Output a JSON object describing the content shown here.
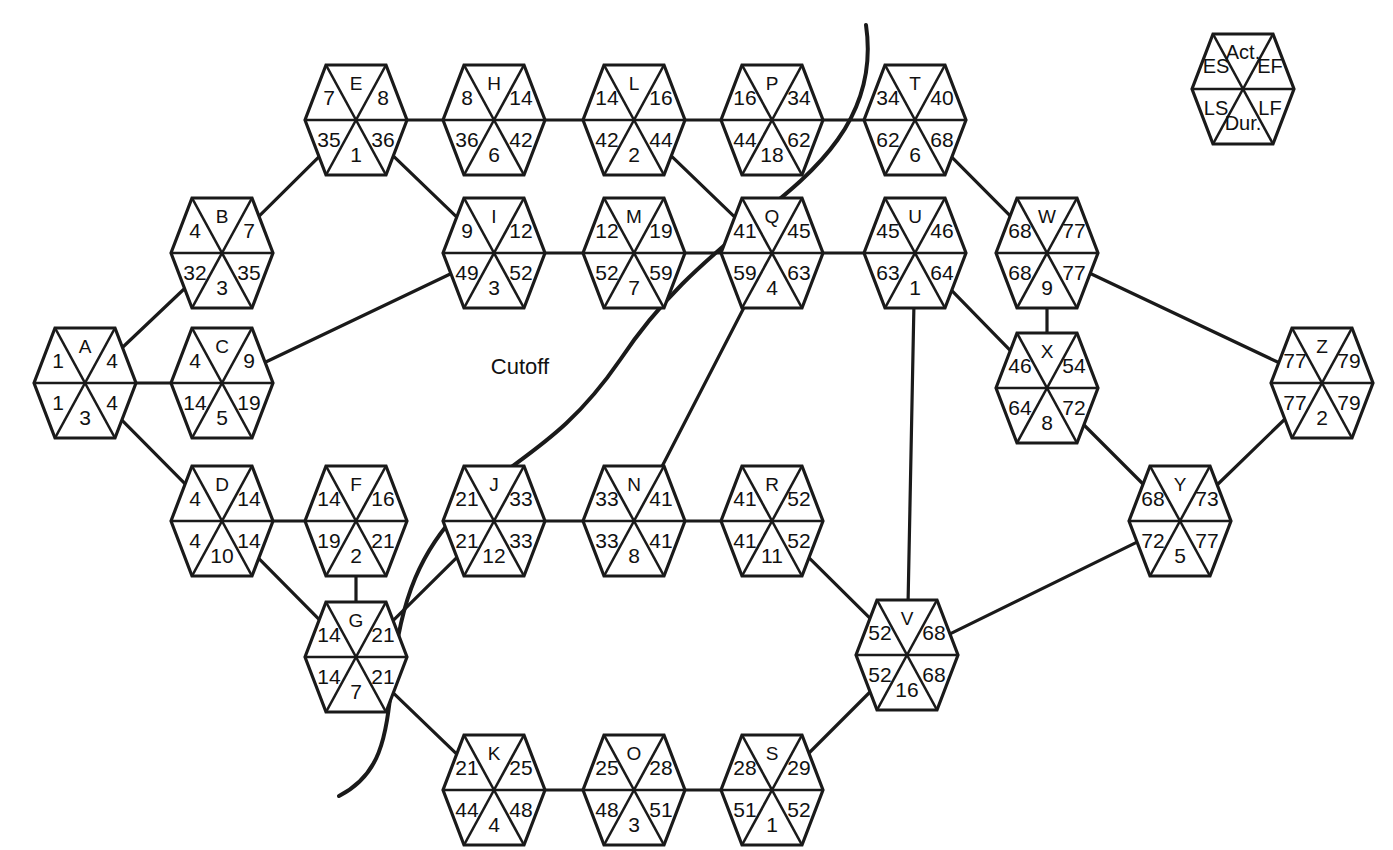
{
  "diagram": {
    "cutoff_label": "Cutoff",
    "node_shape": "hexagon",
    "line_color": "#1a1a1a",
    "background_color": "#ffffff",
    "legend": {
      "name": "legend-hexagon",
      "act": "Act.",
      "es": "ES",
      "ef": "EF",
      "ls": "LS",
      "lf": "LF",
      "dur": "Dur.",
      "cx": 1243,
      "cy": 89
    },
    "nodes": [
      {
        "id": "A",
        "act": "A",
        "es": "1",
        "ef": "4",
        "ls": "1",
        "lf": "4",
        "dur": "3",
        "cx": 85,
        "cy": 383
      },
      {
        "id": "B",
        "act": "B",
        "es": "4",
        "ef": "7",
        "ls": "32",
        "lf": "35",
        "dur": "3",
        "cx": 222,
        "cy": 253
      },
      {
        "id": "C",
        "act": "C",
        "es": "4",
        "ef": "9",
        "ls": "14",
        "lf": "19",
        "dur": "5",
        "cx": 222,
        "cy": 383
      },
      {
        "id": "D",
        "act": "D",
        "es": "4",
        "ef": "14",
        "ls": "4",
        "lf": "14",
        "dur": "10",
        "cx": 222,
        "cy": 521
      },
      {
        "id": "E",
        "act": "E",
        "es": "7",
        "ef": "8",
        "ls": "35",
        "lf": "36",
        "dur": "1",
        "cx": 356,
        "cy": 120
      },
      {
        "id": "F",
        "act": "F",
        "es": "14",
        "ef": "16",
        "ls": "19",
        "lf": "21",
        "dur": "2",
        "cx": 356,
        "cy": 521
      },
      {
        "id": "G",
        "act": "G",
        "es": "14",
        "ef": "21",
        "ls": "14",
        "lf": "21",
        "dur": "7",
        "cx": 356,
        "cy": 657
      },
      {
        "id": "H",
        "act": "H",
        "es": "8",
        "ef": "14",
        "ls": "36",
        "lf": "42",
        "dur": "6",
        "cx": 494,
        "cy": 120
      },
      {
        "id": "I",
        "act": "I",
        "es": "9",
        "ef": "12",
        "ls": "49",
        "lf": "52",
        "dur": "3",
        "cx": 494,
        "cy": 253
      },
      {
        "id": "J",
        "act": "J",
        "es": "21",
        "ef": "33",
        "ls": "21",
        "lf": "33",
        "dur": "12",
        "cx": 494,
        "cy": 521
      },
      {
        "id": "K",
        "act": "K",
        "es": "21",
        "ef": "25",
        "ls": "44",
        "lf": "48",
        "dur": "4",
        "cx": 494,
        "cy": 790
      },
      {
        "id": "L",
        "act": "L",
        "es": "14",
        "ef": "16",
        "ls": "42",
        "lf": "44",
        "dur": "2",
        "cx": 634,
        "cy": 120
      },
      {
        "id": "M",
        "act": "M",
        "es": "12",
        "ef": "19",
        "ls": "52",
        "lf": "59",
        "dur": "7",
        "cx": 634,
        "cy": 253
      },
      {
        "id": "N",
        "act": "N",
        "es": "33",
        "ef": "41",
        "ls": "33",
        "lf": "41",
        "dur": "8",
        "cx": 634,
        "cy": 521
      },
      {
        "id": "O",
        "act": "O",
        "es": "25",
        "ef": "28",
        "ls": "48",
        "lf": "51",
        "dur": "3",
        "cx": 634,
        "cy": 790
      },
      {
        "id": "P",
        "act": "P",
        "es": "16",
        "ef": "34",
        "ls": "44",
        "lf": "62",
        "dur": "18",
        "cx": 772,
        "cy": 120
      },
      {
        "id": "Q",
        "act": "Q",
        "es": "41",
        "ef": "45",
        "ls": "59",
        "lf": "63",
        "dur": "4",
        "cx": 772,
        "cy": 253
      },
      {
        "id": "R",
        "act": "R",
        "es": "41",
        "ef": "52",
        "ls": "41",
        "lf": "52",
        "dur": "11",
        "cx": 772,
        "cy": 521
      },
      {
        "id": "S",
        "act": "S",
        "es": "28",
        "ef": "29",
        "ls": "51",
        "lf": "52",
        "dur": "1",
        "cx": 772,
        "cy": 790
      },
      {
        "id": "T",
        "act": "T",
        "es": "34",
        "ef": "40",
        "ls": "62",
        "lf": "68",
        "dur": "6",
        "cx": 915,
        "cy": 120
      },
      {
        "id": "U",
        "act": "U",
        "es": "45",
        "ef": "46",
        "ls": "63",
        "lf": "64",
        "dur": "1",
        "cx": 915,
        "cy": 253
      },
      {
        "id": "V",
        "act": "V",
        "es": "52",
        "ef": "68",
        "ls": "52",
        "lf": "68",
        "dur": "16",
        "cx": 907,
        "cy": 655
      },
      {
        "id": "W",
        "act": "W",
        "es": "68",
        "ef": "77",
        "ls": "68",
        "lf": "77",
        "dur": "9",
        "cx": 1047,
        "cy": 253
      },
      {
        "id": "X",
        "act": "X",
        "es": "46",
        "ef": "54",
        "ls": "64",
        "lf": "72",
        "dur": "8",
        "cx": 1047,
        "cy": 388
      },
      {
        "id": "Y",
        "act": "Y",
        "es": "68",
        "ef": "73",
        "ls": "72",
        "lf": "77",
        "dur": "5",
        "cx": 1180,
        "cy": 521
      },
      {
        "id": "Z",
        "act": "Z",
        "es": "77",
        "ef": "79",
        "ls": "77",
        "lf": "79",
        "dur": "2",
        "cx": 1322,
        "cy": 383
      }
    ],
    "edges": [
      {
        "from": "A",
        "to": "B"
      },
      {
        "from": "A",
        "to": "C"
      },
      {
        "from": "A",
        "to": "D"
      },
      {
        "from": "B",
        "to": "E"
      },
      {
        "from": "C",
        "to": "I"
      },
      {
        "from": "D",
        "to": "F"
      },
      {
        "from": "D",
        "to": "G"
      },
      {
        "from": "E",
        "to": "H"
      },
      {
        "from": "E",
        "to": "I"
      },
      {
        "from": "F",
        "to": "G"
      },
      {
        "from": "G",
        "to": "J"
      },
      {
        "from": "G",
        "to": "K"
      },
      {
        "from": "H",
        "to": "L"
      },
      {
        "from": "I",
        "to": "M"
      },
      {
        "from": "J",
        "to": "N"
      },
      {
        "from": "K",
        "to": "O"
      },
      {
        "from": "L",
        "to": "P"
      },
      {
        "from": "L",
        "to": "Q"
      },
      {
        "from": "M",
        "to": "Q"
      },
      {
        "from": "N",
        "to": "Q"
      },
      {
        "from": "N",
        "to": "R"
      },
      {
        "from": "O",
        "to": "S"
      },
      {
        "from": "P",
        "to": "T"
      },
      {
        "from": "Q",
        "to": "U"
      },
      {
        "from": "R",
        "to": "V"
      },
      {
        "from": "S",
        "to": "V"
      },
      {
        "from": "T",
        "to": "W"
      },
      {
        "from": "U",
        "to": "V"
      },
      {
        "from": "U",
        "to": "X"
      },
      {
        "from": "W",
        "to": "X"
      },
      {
        "from": "W",
        "to": "Z"
      },
      {
        "from": "X",
        "to": "Y"
      },
      {
        "from": "V",
        "to": "Y"
      },
      {
        "from": "Y",
        "to": "Z"
      }
    ],
    "cutoff_curve_path": "M 866 25 C 880 120, 810 175, 760 215 C 700 265, 660 300, 620 360 C 565 440, 520 455, 470 500 C 420 548, 400 600, 392 680 C 386 740, 380 775, 339 796",
    "cutoff_label_pos": {
      "x": 520,
      "y": 368
    }
  }
}
